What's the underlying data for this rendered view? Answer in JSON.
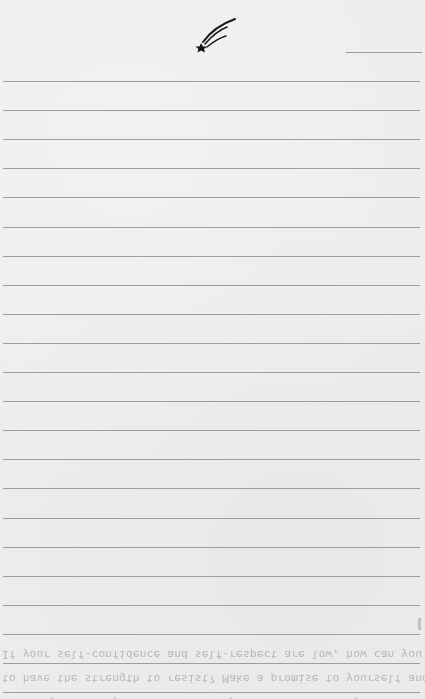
{
  "page": {
    "type": "lined notebook page",
    "background_color": "#ededed",
    "rule_color": "#9e9e9e",
    "rule_count": 21,
    "rule_start_y": 81,
    "rule_spacing": 29.1
  },
  "header": {
    "logo_icon": "shooting-star-icon",
    "date_field_label": ""
  },
  "bleed_through_text": {
    "lines": [
      "If your self-confidence and self-respect are low, how can you expect",
      "to have the strength to resist? Make a promise to yourself and keep",
      "it. Help somebody in need. Develop a talent. Renew yourself. Even"
    ]
  }
}
